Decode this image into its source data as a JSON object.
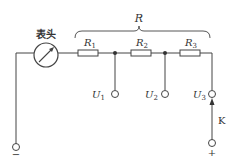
{
  "diagram": {
    "meter_label": "表头",
    "brace_label": "R",
    "resistors": [
      {
        "name": "R",
        "sub": "1"
      },
      {
        "name": "R",
        "sub": "2"
      },
      {
        "name": "R",
        "sub": "3"
      }
    ],
    "terminals": [
      {
        "name": "U",
        "sub": "1"
      },
      {
        "name": "U",
        "sub": "2"
      },
      {
        "name": "U",
        "sub": "3"
      }
    ],
    "switch_label": "K",
    "negative_sign": "−",
    "positive_sign": "+",
    "colors": {
      "line": "#444444",
      "background": "#ffffff"
    }
  }
}
